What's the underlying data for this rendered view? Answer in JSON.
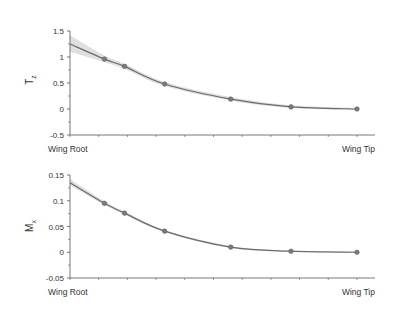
{
  "chart_data": [
    {
      "type": "line",
      "title": "",
      "xlabel": "",
      "ylabel": "T_z",
      "ylabel_main": "T",
      "ylabel_sub": "z",
      "x_tick_labels": [
        "Wing Root",
        "Wing Tip"
      ],
      "ylim": [
        -0.5,
        1.5
      ],
      "yticks": [
        -0.5,
        0,
        0.5,
        1,
        1.5
      ],
      "ytick_labels": [
        "-0.5",
        "0",
        "0.5",
        "1",
        "1.5"
      ],
      "grid": false,
      "legend": null,
      "x": [
        0.0,
        0.12,
        0.19,
        0.33,
        0.56,
        0.77,
        1.0
      ],
      "values": [
        1.25,
        0.96,
        0.82,
        0.48,
        0.19,
        0.04,
        0.0
      ],
      "markers_x": [
        0.12,
        0.19,
        0.33,
        0.56,
        0.77,
        1.0
      ],
      "markers_y": [
        0.96,
        0.82,
        0.48,
        0.19,
        0.04,
        0.0
      ],
      "band_upper": [
        1.42,
        1.03,
        0.87,
        0.52,
        0.23,
        0.07,
        0.02
      ],
      "band_lower": [
        1.1,
        0.9,
        0.77,
        0.44,
        0.16,
        0.02,
        -0.02
      ]
    },
    {
      "type": "line",
      "title": "",
      "xlabel": "",
      "ylabel": "M_x",
      "ylabel_main": "M",
      "ylabel_sub": "x",
      "x_tick_labels": [
        "Wing Root",
        "Wing Tip"
      ],
      "ylim": [
        -0.05,
        0.15
      ],
      "yticks": [
        -0.05,
        0,
        0.05,
        0.1,
        0.15
      ],
      "ytick_labels": [
        "-0.05",
        "0",
        "0.05",
        "0.1",
        "0.15"
      ],
      "grid": false,
      "legend": null,
      "x": [
        0.0,
        0.12,
        0.19,
        0.33,
        0.56,
        0.77,
        1.0
      ],
      "values": [
        0.135,
        0.095,
        0.076,
        0.041,
        0.01,
        0.002,
        0.0
      ],
      "markers_x": [
        0.12,
        0.19,
        0.33,
        0.56,
        0.77,
        1.0
      ],
      "markers_y": [
        0.095,
        0.076,
        0.041,
        0.01,
        0.002,
        0.0
      ],
      "band_upper": [
        0.142,
        0.099,
        0.079,
        0.043,
        0.012,
        0.003,
        0.001
      ],
      "band_lower": [
        0.13,
        0.092,
        0.073,
        0.039,
        0.008,
        0.001,
        -0.001
      ]
    }
  ],
  "colors": {
    "line": "#6b6b6b",
    "marker": "#7a7a7a",
    "band": "#d4d4d4",
    "axis": "#555555",
    "text": "#333333"
  }
}
